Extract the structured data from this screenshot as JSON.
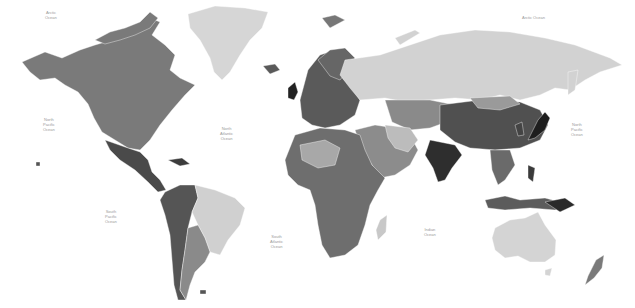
{
  "map": {
    "type": "political world map",
    "style": "grayscale",
    "background_color": "#ffffff",
    "oceans": [
      {
        "id": "arctic-nw",
        "label": "Arctic\nOcean",
        "x": 52,
        "y": 15
      },
      {
        "id": "arctic-ne",
        "label": "Arctic Ocean",
        "x": 535,
        "y": 17
      },
      {
        "id": "north-pacific-w",
        "label": "North\nPacific\nOcean",
        "x": 50,
        "y": 122
      },
      {
        "id": "north-atlantic",
        "label": "North\nAtlantic\nOcean",
        "x": 228,
        "y": 131
      },
      {
        "id": "north-pacific-e",
        "label": "North\nPacific\nOcean",
        "x": 578,
        "y": 127
      },
      {
        "id": "south-pacific",
        "label": "South\nPacific\nOcean",
        "x": 112,
        "y": 214
      },
      {
        "id": "south-atlantic",
        "label": "South\nAtlantic\nOcean",
        "x": 277,
        "y": 239
      },
      {
        "id": "indian",
        "label": "Indian\nOcean",
        "x": 431,
        "y": 230
      }
    ],
    "colors": {
      "north_america": "#7a7a7a",
      "greenland": "#d6d6d6",
      "russia": "#d2d2d2",
      "europe": "#5a5a5a",
      "china": "#505050",
      "india": "#2e2e2e",
      "middle_east": "#8c8c8c",
      "africa": "#6e6e6e",
      "south_america_brazil": "#d0d0d0",
      "south_america_west": "#555555",
      "argentina": "#8a8a8a",
      "australia": "#d4d4d4",
      "southeast_asia": "#6a6a6a",
      "japan": "#1e1e1e",
      "mexico": "#4a4a4a"
    }
  }
}
